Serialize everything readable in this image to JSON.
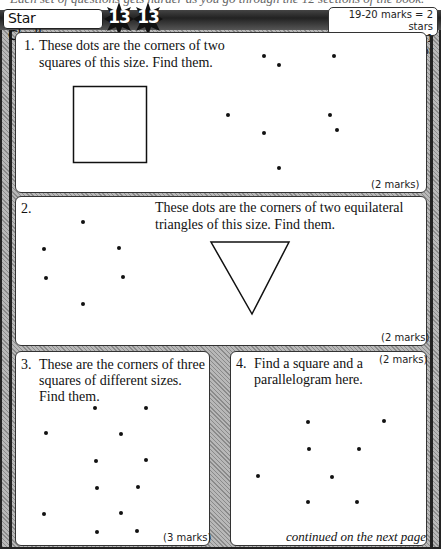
{
  "header": {
    "cut_text": "Each set of questions gets harder as you go through the 12 sections of the book.",
    "title": "Star Challenge",
    "stars": [
      "13",
      "13"
    ],
    "scoring": {
      "line1": "19-20 marks = 2 stars",
      "line2": "15-18 marks = 1 star"
    }
  },
  "questions": [
    {
      "number": "1.",
      "text_line1": "These dots are the corners of two",
      "text_line2": "squares of this size. Find them.",
      "marks": "(2 marks)",
      "shape": "square",
      "dots": [
        [
          264,
          56
        ],
        [
          279,
          65
        ],
        [
          334,
          56
        ],
        [
          228,
          115
        ],
        [
          330,
          115
        ],
        [
          264,
          133
        ],
        [
          337,
          130
        ],
        [
          279,
          168
        ]
      ]
    },
    {
      "number": "2.",
      "text_line1": "These dots are the corners of two equilateral",
      "text_line2": "triangles of this size. Find them.",
      "marks": "(2 marks)",
      "shape": "equilateral-triangle",
      "dots": [
        [
          83,
          222
        ],
        [
          44,
          249
        ],
        [
          119,
          248
        ],
        [
          46,
          278
        ],
        [
          123,
          277
        ],
        [
          83,
          304
        ]
      ]
    },
    {
      "number": "3.",
      "text_line1": "These are the corners of three",
      "text_line2": "squares of different sizes.",
      "text_line3": "Find them.",
      "marks": "(3 marks)",
      "dots": [
        [
          95,
          408
        ],
        [
          146,
          408
        ],
        [
          46,
          433
        ],
        [
          121,
          434
        ],
        [
          96,
          461
        ],
        [
          146,
          460
        ],
        [
          97,
          488
        ],
        [
          138,
          487
        ],
        [
          44,
          514
        ],
        [
          121,
          513
        ],
        [
          97,
          532
        ],
        [
          137,
          531
        ]
      ]
    },
    {
      "number": "4.",
      "text_line1": "Find a square and a",
      "text_line2": "parallelogram here.",
      "marks": "(2 marks)",
      "dots": [
        [
          308,
          422
        ],
        [
          384,
          421
        ],
        [
          309,
          449
        ],
        [
          359,
          449
        ],
        [
          258,
          476
        ],
        [
          332,
          477
        ],
        [
          308,
          502
        ],
        [
          357,
          502
        ]
      ]
    }
  ],
  "footer": {
    "continued": "continued on the next page"
  },
  "colors": {
    "frame_dark": "#222222",
    "hatch_light": "#b8b8b8",
    "panel_bg": "#ffffff",
    "star_fill": "#111111"
  }
}
